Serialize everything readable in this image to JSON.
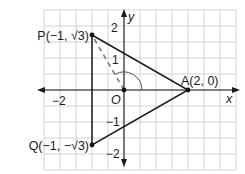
{
  "diagram": {
    "type": "coordinate-plane-triangle",
    "axes": {
      "x_label": "x",
      "y_label": "y",
      "x_range": [
        -2.5,
        3.5
      ],
      "y_range": [
        -2.5,
        2.5
      ]
    },
    "origin_label": "O",
    "ticks": {
      "x": [
        {
          "value": -2,
          "label": "−2"
        }
      ],
      "y": [
        {
          "value": 2,
          "label": "2"
        },
        {
          "value": 1,
          "label": "1"
        },
        {
          "value": -1,
          "label": "−1"
        },
        {
          "value": -2,
          "label": "−2"
        }
      ]
    },
    "points": [
      {
        "name": "P",
        "x": -1,
        "y": 1.732,
        "label": "P(−1, √3)"
      },
      {
        "name": "Q",
        "x": -1,
        "y": -1.732,
        "label": "Q(−1, −√3)"
      },
      {
        "name": "A",
        "x": 2,
        "y": 0,
        "label": "A(2, 0)"
      },
      {
        "name": "O",
        "x": 0,
        "y": 0,
        "label": "O"
      }
    ],
    "triangle": [
      "P",
      "A",
      "Q"
    ],
    "dashed_segment": [
      "O",
      "P"
    ],
    "angle_arc": {
      "vertex": "O",
      "from": "A",
      "to": "P",
      "degrees": 120
    },
    "colors": {
      "grid": "#c9c9c9",
      "lines": "#1a1a1a",
      "dashed": "#7a7a7a"
    }
  }
}
